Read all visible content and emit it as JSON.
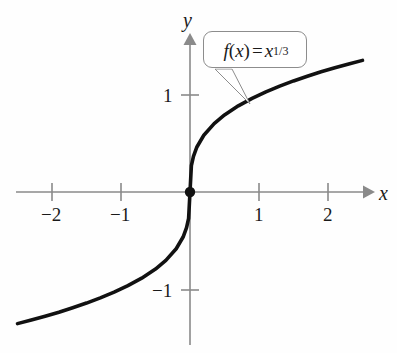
{
  "chart_data": {
    "type": "line",
    "title": "",
    "function_label": "f(x) = x^1/3",
    "xlabel": "x",
    "ylabel": "y",
    "xlim": [
      -2.75,
      2.6
    ],
    "ylim": [
      -1.6,
      1.6
    ],
    "xticks": [
      -2,
      -1,
      1,
      2
    ],
    "xtick_labels": [
      "−2",
      "−1",
      "1",
      "2"
    ],
    "yticks": [
      -1,
      1
    ],
    "ytick_labels": [
      "−1",
      "1"
    ],
    "grid": false,
    "legend": "none",
    "series": [
      {
        "name": "f(x) = x^1/3",
        "color": "#111111",
        "x": [
          -2.5,
          -2.3,
          -2.1,
          -1.9,
          -1.7,
          -1.5,
          -1.3,
          -1.1,
          -0.9,
          -0.7,
          -0.5,
          -0.35,
          -0.2,
          -0.1,
          -0.05,
          -0.02,
          0,
          0.02,
          0.05,
          0.1,
          0.2,
          0.35,
          0.5,
          0.7,
          0.9,
          1.1,
          1.3,
          1.5,
          1.7,
          1.9,
          2.1,
          2.3,
          2.5
        ],
        "y": [
          -1.357,
          -1.32,
          -1.281,
          -1.239,
          -1.193,
          -1.145,
          -1.091,
          -1.032,
          -0.965,
          -0.888,
          -0.794,
          -0.705,
          -0.585,
          -0.464,
          -0.368,
          -0.271,
          0,
          0.271,
          0.368,
          0.464,
          0.585,
          0.705,
          0.794,
          0.888,
          0.965,
          1.032,
          1.091,
          1.145,
          1.193,
          1.239,
          1.281,
          1.32,
          1.357
        ]
      }
    ],
    "markers": [
      {
        "name": "origin-point",
        "x": 0,
        "y": 0,
        "color": "#111111"
      }
    ],
    "annotations": [
      {
        "name": "function-callout",
        "text": "f(x) = x^1/3",
        "points_to_x": 0.87,
        "points_to_y": 0.92
      }
    ],
    "colors": {
      "axis": "#8a8a8a",
      "curve": "#111111",
      "callout_border": "#8d8d8d",
      "text": "#1a1a1a",
      "background": "#fefefe"
    }
  },
  "labels": {
    "x_axis_name": "x",
    "y_axis_name": "y",
    "x_neg2": "−2",
    "x_neg1": "−1",
    "x_pos1": "1",
    "x_pos2": "2",
    "y_pos1": "1",
    "y_neg1": "−1"
  },
  "callout": {
    "f_of": "f",
    "open_paren": "(",
    "var": "x",
    "close_paren": ")",
    "equals": "=",
    "base": "x",
    "exponent": "1/3"
  }
}
